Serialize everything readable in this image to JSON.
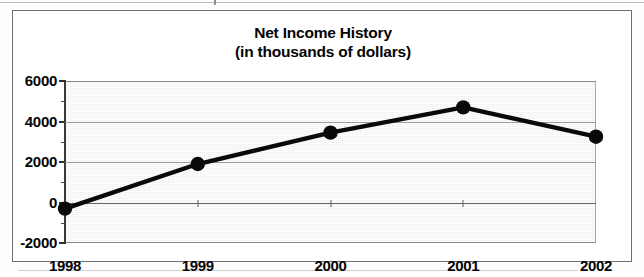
{
  "chart_data": {
    "type": "line",
    "title": "Net Income History",
    "subtitle": "(in thousands of dollars)",
    "xlabel": "",
    "ylabel": "",
    "categories": [
      "1998",
      "1999",
      "2000",
      "2001",
      "2002"
    ],
    "values": [
      -300,
      1900,
      3450,
      4700,
      3250
    ],
    "series": [
      {
        "name": "Net Income",
        "values": [
          -300,
          1900,
          3450,
          4700,
          3250
        ]
      }
    ],
    "ylim": [
      -2000,
      6000
    ],
    "ytick_labels": [
      "6000",
      "4000",
      "2000",
      "0",
      "-2000"
    ],
    "ytick_values": [
      6000,
      4000,
      2000,
      0,
      -2000
    ],
    "yminor_values": [
      5000,
      3000,
      1000,
      -1000
    ],
    "xtick_labels": [
      "1998",
      "1999",
      "2000",
      "2001",
      "2002"
    ],
    "grid": true,
    "legend": "none",
    "marker": "filled-circle",
    "line_color": "#0a0a0a",
    "plot_background": "#ededed"
  },
  "title": {
    "line1": "Net Income History",
    "line2": "(in thousands of dollars)"
  }
}
